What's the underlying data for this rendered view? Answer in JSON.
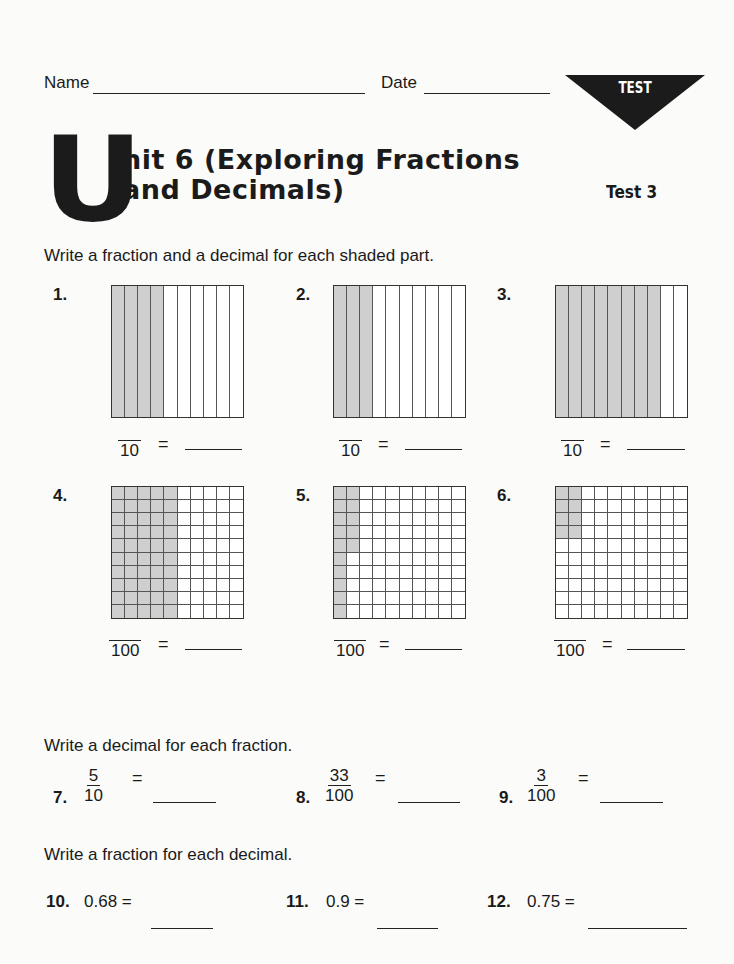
{
  "header": {
    "name_label": "Name",
    "date_label": "Date",
    "badge": "TEST",
    "big_letter": "U",
    "title_line1": "nit 6 (Exploring Fractions",
    "title_line2": "and Decimals)",
    "test_number": "Test 3"
  },
  "section1": {
    "instruction": "Write a fraction and a decimal for each shaded part.",
    "problems": [
      {
        "number": "1.",
        "denominator": "10",
        "grid": "tenths",
        "shaded_columns": 4
      },
      {
        "number": "2.",
        "denominator": "10",
        "grid": "tenths",
        "shaded_columns": 3
      },
      {
        "number": "3.",
        "denominator": "10",
        "grid": "tenths",
        "shaded_columns": 8
      },
      {
        "number": "4.",
        "denominator": "100",
        "grid": "hundredths",
        "shaded_cells": 50
      },
      {
        "number": "5.",
        "denominator": "100",
        "grid": "hundredths",
        "shaded_cells": 15
      },
      {
        "number": "6.",
        "denominator": "100",
        "grid": "hundredths",
        "shaded_cells": 8
      }
    ],
    "equals": "="
  },
  "section2": {
    "instruction": "Write a decimal for each fraction.",
    "problems": [
      {
        "number": "7.",
        "numerator": "5",
        "denominator": "10"
      },
      {
        "number": "8.",
        "numerator": "33",
        "denominator": "100"
      },
      {
        "number": "9.",
        "numerator": "3",
        "denominator": "100"
      }
    ],
    "equals": "="
  },
  "section3": {
    "instruction": "Write a fraction for each decimal.",
    "problems": [
      {
        "number": "10.",
        "decimal": "0.68 ="
      },
      {
        "number": "11.",
        "decimal": "0.9 ="
      },
      {
        "number": "12.",
        "decimal": "0.75 ="
      }
    ]
  }
}
